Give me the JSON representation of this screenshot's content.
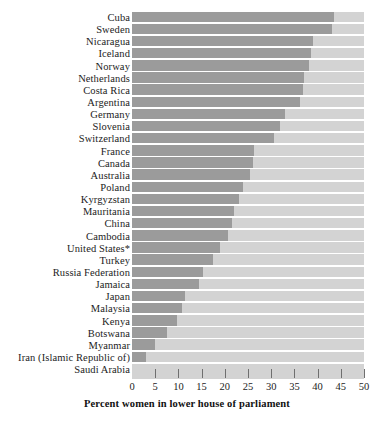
{
  "chart_data": {
    "type": "bar",
    "orientation": "horizontal",
    "title": "",
    "xlabel": "Percent women in lower house of parliament",
    "ylabel": "",
    "xlim": [
      0,
      50
    ],
    "xticks": [
      0,
      5,
      10,
      15,
      20,
      25,
      30,
      35,
      40,
      45,
      50
    ],
    "grid": false,
    "legend": null,
    "colors": {
      "bar": "#9b9b9b",
      "track": "#d3d3d3",
      "text": "#1c1c1c"
    },
    "note": "United States*",
    "categories": [
      "Cuba",
      "Sweden",
      "Nicaragua",
      "Iceland",
      "Norway",
      "Netherlands",
      "Costa Rica",
      "Argentina",
      "Germany",
      "Slovenia",
      "Switzerland",
      "France",
      "Canada",
      "Australia",
      "Poland",
      "Kyrgyzstan",
      "Mauritania",
      "China",
      "Cambodia",
      "United States*",
      "Turkey",
      "Russia Federation",
      "Jamaica",
      "Japan",
      "Malaysia",
      "Kenya",
      "Botswana",
      "Myanmar",
      "Iran (Islamic Republic of)",
      "Saudi Arabia"
    ],
    "values": [
      43.6,
      43.0,
      39.1,
      38.5,
      38.2,
      37.0,
      36.8,
      36.2,
      33.0,
      32.0,
      30.5,
      26.3,
      26.0,
      25.5,
      23.9,
      23.0,
      22.0,
      21.5,
      20.7,
      19.0,
      17.5,
      15.3,
      14.5,
      11.5,
      10.8,
      9.8,
      7.5,
      5.0,
      3.1,
      0.0
    ]
  },
  "axis": {
    "tick_labels": [
      "0",
      "5",
      "10",
      "15",
      "20",
      "25",
      "30",
      "35",
      "40",
      "45",
      "50"
    ],
    "title": "Percent women in lower house of parliament"
  }
}
